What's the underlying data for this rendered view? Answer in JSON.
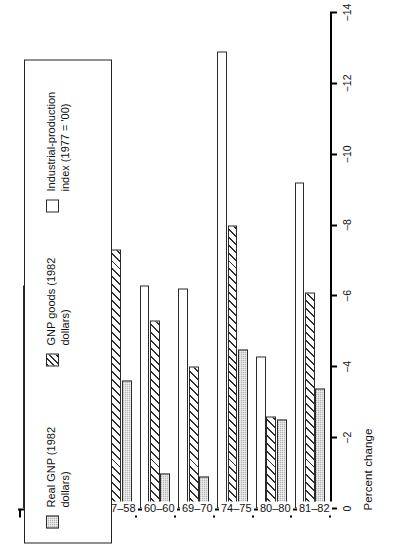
{
  "chart_data": {
    "type": "bar",
    "orientation": "horizontal",
    "title": "",
    "xlabel": "Percent change",
    "ylabel": "",
    "xlim": [
      0,
      -14
    ],
    "xticks": [
      0,
      -2,
      -4,
      -6,
      -8,
      -10,
      -12,
      -14
    ],
    "xtick_labels": [
      "0",
      "−2",
      "−4",
      "−6",
      "−8",
      "−10",
      "−12",
      "−14"
    ],
    "grid": false,
    "legend_position": "right",
    "categories": [
      "49–49",
      "53–54",
      "57–58",
      "60–60",
      "69–70",
      "74–75",
      "80–80",
      "81–82"
    ],
    "series": [
      {
        "name": "Real GNP (1982 dollars)",
        "key": "gnp",
        "values": [
          -2.0,
          -3.0,
          -3.6,
          -1.0,
          -0.9,
          -4.5,
          -2.5,
          -3.4
        ]
      },
      {
        "name": "GNP goods (1982 dollars)",
        "key": "goods",
        "values": [
          -6.0,
          -7.3,
          -7.3,
          -5.3,
          -4.0,
          -8.0,
          -2.6,
          -6.1
        ]
      },
      {
        "name": "Industrial-production index (1977 = '00)",
        "key": "ip",
        "values": [
          -6.3,
          -8.0,
          -9.8,
          -6.3,
          -6.2,
          -12.9,
          -4.3,
          -9.2
        ]
      }
    ]
  },
  "axis": {
    "x_title": "Percent change"
  },
  "legend": {
    "entries": [
      {
        "label": "Real GNP (1982\ndollars)",
        "key": "gnp"
      },
      {
        "label": "GNP goods (1982\ndollars)",
        "key": "goods"
      },
      {
        "label": "Industrial-production\nindex (1977 = '00)",
        "key": "ip"
      }
    ]
  }
}
